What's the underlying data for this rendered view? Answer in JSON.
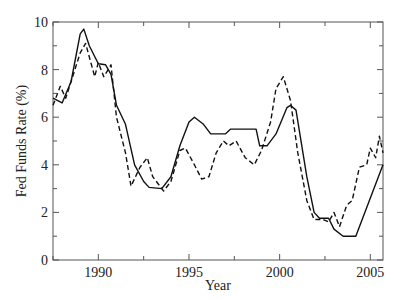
{
  "chart_data": {
    "type": "line",
    "title": "",
    "xlabel": "Year",
    "ylabel": "Fed Funds Rate (%)",
    "xlim": [
      1987.5,
      2005.7
    ],
    "ylim": [
      0,
      10
    ],
    "grid": false,
    "legend": null,
    "x_ticks": [
      {
        "value": 1990,
        "label": "1990"
      },
      {
        "value": 1995,
        "label": "1995"
      },
      {
        "value": 2000,
        "label": "2000"
      },
      {
        "value": 2005,
        "label": "2005"
      }
    ],
    "x_minor_ticks": [
      1987.5,
      1992.5,
      1997.5,
      2002.5
    ],
    "y_ticks": [
      {
        "value": 0,
        "label": "0"
      },
      {
        "value": 2,
        "label": "2"
      },
      {
        "value": 4,
        "label": "4"
      },
      {
        "value": 6,
        "label": "6"
      },
      {
        "value": 8,
        "label": "8"
      },
      {
        "value": 10,
        "label": "10"
      }
    ],
    "y_minor_ticks": [
      1,
      3,
      5,
      7,
      9
    ],
    "series": [
      {
        "name": "Actual",
        "style": "solid",
        "color": "#111111",
        "x": [
          1987.5,
          1988.0,
          1988.5,
          1989.0,
          1989.2,
          1989.5,
          1990.0,
          1990.4,
          1990.7,
          1991.0,
          1991.5,
          1992.0,
          1992.5,
          1992.8,
          1993.5,
          1994.0,
          1994.5,
          1995.0,
          1995.3,
          1995.8,
          1996.2,
          1997.0,
          1997.3,
          1998.7,
          1998.9,
          1999.3,
          1999.8,
          2000.4,
          2000.6,
          2000.9,
          2001.5,
          2001.9,
          2002.2,
          2002.7,
          2003.0,
          2003.5,
          2004.2,
          2005.7
        ],
        "y": [
          6.8,
          6.6,
          7.5,
          9.5,
          9.7,
          9.0,
          8.25,
          8.2,
          7.8,
          6.5,
          5.7,
          4.0,
          3.3,
          3.05,
          3.0,
          3.5,
          4.8,
          5.8,
          6.0,
          5.7,
          5.3,
          5.3,
          5.5,
          5.5,
          4.8,
          4.8,
          5.3,
          6.4,
          6.5,
          6.3,
          3.5,
          2.0,
          1.75,
          1.75,
          1.3,
          1.0,
          1.0,
          4.0
        ]
      },
      {
        "name": "Model",
        "style": "dashed",
        "color": "#111111",
        "x": [
          1987.5,
          1987.9,
          1988.2,
          1988.5,
          1989.0,
          1989.3,
          1989.8,
          1990.0,
          1990.3,
          1990.7,
          1991.0,
          1991.5,
          1991.8,
          1992.3,
          1992.7,
          1993.0,
          1993.6,
          1994.0,
          1994.5,
          1994.8,
          1995.3,
          1995.7,
          1996.1,
          1996.5,
          1996.9,
          1997.2,
          1997.6,
          1998.1,
          1998.6,
          1999.0,
          1999.5,
          1999.8,
          2000.2,
          2000.6,
          2001.0,
          2001.5,
          2001.9,
          2002.4,
          2002.7,
          2003.0,
          2003.3,
          2003.7,
          2004.0,
          2004.4,
          2004.8,
          2005.0,
          2005.3,
          2005.5,
          2005.7
        ],
        "y": [
          6.5,
          7.3,
          6.8,
          7.5,
          8.7,
          9.1,
          7.7,
          8.3,
          7.7,
          8.2,
          6.0,
          4.5,
          3.1,
          3.9,
          4.3,
          3.5,
          2.9,
          3.3,
          4.6,
          4.7,
          4.0,
          3.4,
          3.5,
          4.5,
          5.0,
          4.8,
          5.0,
          4.3,
          4.0,
          4.6,
          5.8,
          7.2,
          7.7,
          6.7,
          4.5,
          2.5,
          1.7,
          1.7,
          1.6,
          2.0,
          1.4,
          2.3,
          2.5,
          3.9,
          4.0,
          4.7,
          4.3,
          5.2,
          4.5
        ]
      }
    ]
  },
  "plot_area": {
    "left": 53,
    "right": 383,
    "top": 22,
    "bottom": 260
  }
}
